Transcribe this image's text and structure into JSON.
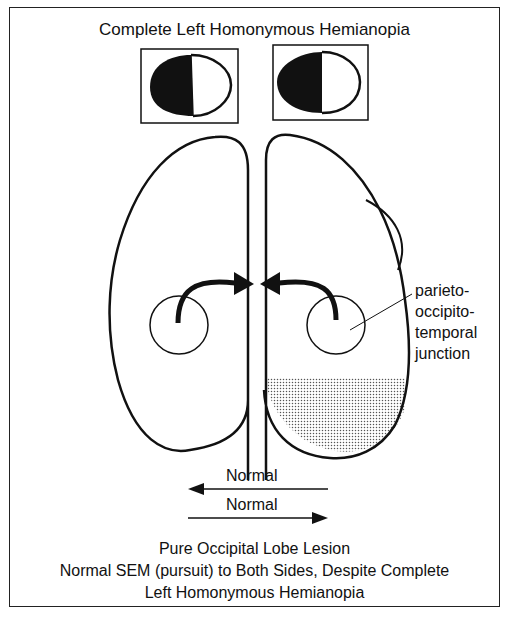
{
  "title": "Complete Left Homonymous Hemianopia",
  "visual_fields": [
    {
      "eye": "left",
      "blind_half": "left"
    },
    {
      "eye": "right",
      "blind_half": "left"
    }
  ],
  "brain": {
    "label": {
      "line1": "parieto-",
      "line2": "occipito-",
      "line3": "temporal",
      "line4": "junction"
    },
    "lesion_region": "right occipital lobe (stippled)"
  },
  "pursuit": {
    "left_label": "Normal",
    "right_label": "Normal"
  },
  "caption": {
    "line1": "Pure Occipital Lobe Lesion",
    "line2": "Normal SEM (pursuit) to Both Sides, Despite Complete",
    "line3": "Left Homonymous Hemianopia"
  },
  "colors": {
    "ink": "#111111",
    "background": "#ffffff"
  }
}
